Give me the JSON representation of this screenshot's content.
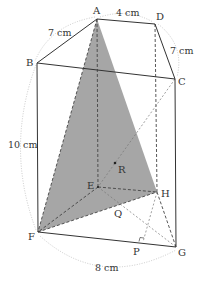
{
  "diagram": {
    "type": "rectangular prism with inscribed triangle",
    "vertices": {
      "A": {
        "label": "A",
        "x": 97,
        "y": 19
      },
      "B": {
        "label": "B",
        "x": 37,
        "y": 63
      },
      "C": {
        "label": "C",
        "x": 175,
        "y": 79
      },
      "D": {
        "label": "D",
        "x": 155,
        "y": 24
      },
      "E": {
        "label": "E",
        "x": 98,
        "y": 187
      },
      "F": {
        "label": "F",
        "x": 38,
        "y": 232
      },
      "G": {
        "label": "G",
        "x": 176,
        "y": 247
      },
      "H": {
        "label": "H",
        "x": 157,
        "y": 192
      }
    },
    "points": {
      "P": {
        "label": "P",
        "x": 143,
        "y": 242
      },
      "Q": {
        "label": "Q",
        "x": 119,
        "y": 206
      },
      "R": {
        "label": "R",
        "x": 115,
        "y": 163
      }
    },
    "shaded_triangle": [
      "A",
      "F",
      "H"
    ],
    "shade_color": "#a6a6a6",
    "dimensions": {
      "AD": "4 cm",
      "AB": "7 cm",
      "DC": "7 cm",
      "BF": "10 cm",
      "FG": "8 cm"
    }
  }
}
